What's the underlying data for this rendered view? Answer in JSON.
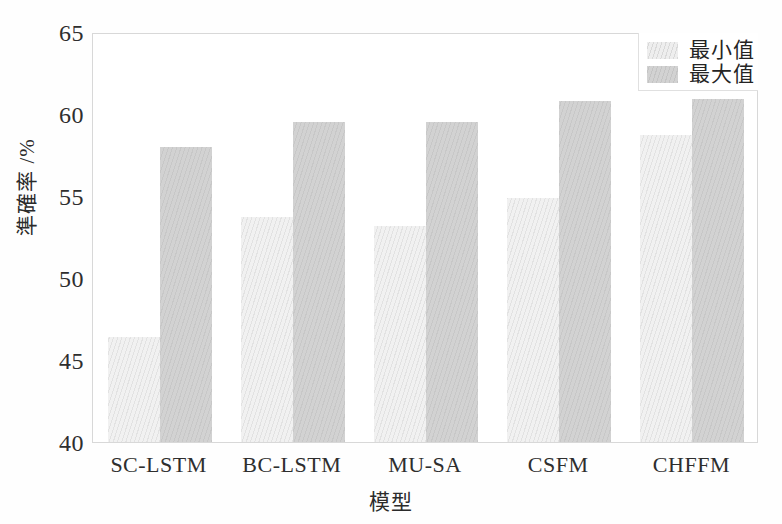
{
  "chart_data": {
    "type": "bar",
    "title": "",
    "subtitle": "",
    "xlabel": "模型",
    "ylabel": "準確率 /%",
    "categories": [
      "SC-LSTM",
      "BC-LSTM",
      "MU-SA",
      "CSFM",
      "CHFFM"
    ],
    "series": [
      {
        "name": "最小值",
        "values": [
          46.4,
          53.7,
          53.2,
          54.9,
          58.7
        ],
        "color": "#f1f1f1"
      },
      {
        "name": "最大值",
        "values": [
          58.0,
          59.5,
          59.5,
          60.8,
          60.9
        ],
        "color": "#d2d2d2"
      }
    ],
    "ylim": [
      40,
      65
    ],
    "yticks": [
      40,
      45,
      50,
      55,
      60,
      65
    ],
    "ytick_labels": [
      "40",
      "45",
      "50",
      "55",
      "60",
      "65"
    ],
    "grid": false,
    "legend_position": "top-right",
    "legend_entries": [
      "最小值",
      "最大值"
    ]
  },
  "axes": {
    "y_title": "準確率 /%",
    "x_title": "模型"
  },
  "legend": {
    "items": [
      {
        "label": "最小值"
      },
      {
        "label": "最大值"
      }
    ]
  },
  "colors": {
    "bar_min": "#f1f1f1",
    "bar_max": "#d2d2d2",
    "frame": "#d8d8d8",
    "text": "#2e2e2e",
    "background": "#ffffff"
  }
}
